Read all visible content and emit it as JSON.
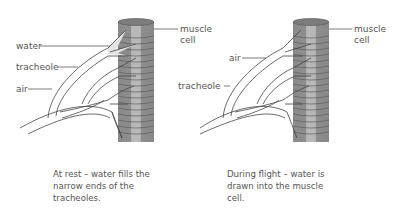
{
  "panels": [
    {
      "id": "at-rest",
      "labels": {
        "water": "water",
        "tracheole": "tracheole",
        "air": "air",
        "muscle_cell_line1": "muscle",
        "muscle_cell_line2": "cell"
      },
      "caption_lines": [
        "At rest – water fills the",
        "narrow ends of the",
        "tracheoles."
      ]
    },
    {
      "id": "during-flight",
      "labels": {
        "air": "air",
        "tracheole": "tracheole",
        "muscle_cell_line1": "muscle",
        "muscle_cell_line2": "cell"
      },
      "caption_lines": [
        "During flight – water is",
        "drawn into the muscle",
        "cell."
      ]
    }
  ],
  "colors": {
    "muscle_dark": "#8a8a8a",
    "muscle_light": "#b5b5b5",
    "muscle_top": "#7a7a7a",
    "stripe": "#5a5a5a",
    "water_fill": "#e6e6e6",
    "outline": "#444444"
  }
}
